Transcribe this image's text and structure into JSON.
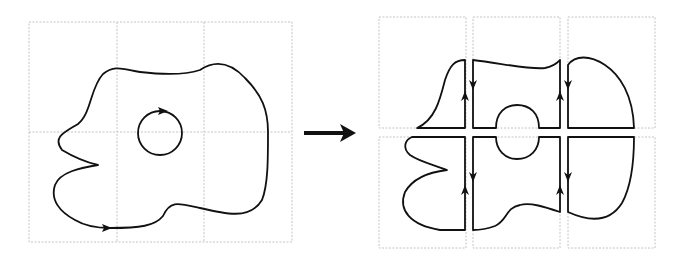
{
  "diagram": {
    "left_panel": {
      "name": "original-region",
      "grid": {
        "cols": 3,
        "rows": 2
      },
      "outer_boundary_orientation": "counterclockwise",
      "hole_orientation": "clockwise"
    },
    "transition_arrow": {
      "direction": "right"
    },
    "right_panel": {
      "name": "decomposed-cells",
      "grid": {
        "cols": 3,
        "rows": 2
      },
      "cells": [
        {
          "id": "top-left",
          "cut_edge_arrows": [
            "up"
          ]
        },
        {
          "id": "top-middle",
          "cut_edge_arrows": [
            "down",
            "up"
          ]
        },
        {
          "id": "top-right",
          "cut_edge_arrows": [
            "down"
          ]
        },
        {
          "id": "bottom-left",
          "cut_edge_arrows": [
            "up"
          ]
        },
        {
          "id": "bottom-middle",
          "cut_edge_arrows": [
            "down",
            "up"
          ]
        },
        {
          "id": "bottom-right",
          "cut_edge_arrows": [
            "down"
          ]
        }
      ]
    },
    "colors": {
      "curve": "#111111",
      "grid": "#c4c4c4",
      "background": "#ffffff"
    }
  }
}
